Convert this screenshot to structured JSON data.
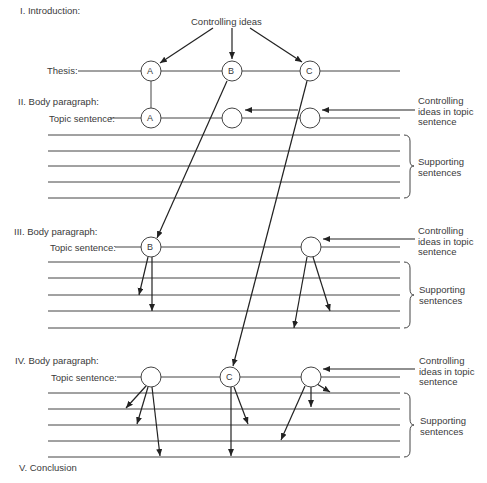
{
  "sections": {
    "intro": "I. Introduction:",
    "body2": "II. Body paragraph:",
    "body3": "III. Body paragraph:",
    "body4": "IV. Body paragraph:",
    "conclusion": "V. Conclusion"
  },
  "labels": {
    "controlling_ideas": "Controlling ideas",
    "thesis": "Thesis:",
    "topic_sentence": "Topic sentence:",
    "controlling_topic_line1": "Controlling",
    "controlling_topic_line2": "ideas in topic",
    "controlling_topic_line3": "sentence",
    "supporting_line1": "Supporting",
    "supporting_line2": "sentences"
  },
  "nodes": {
    "thesis": [
      "A",
      "B",
      "C"
    ],
    "body2": [
      "A",
      "",
      ""
    ],
    "body3": [
      "B",
      ""
    ],
    "body4": [
      "",
      "C",
      ""
    ]
  }
}
